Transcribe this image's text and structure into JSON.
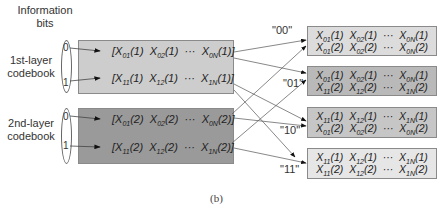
{
  "labels": {
    "information_bits_line1": "Information",
    "information_bits_line2": "bits",
    "layer1_line1": "1st-layer",
    "layer1_line2": "codebook",
    "layer2_line1": "2nd-layer",
    "layer2_line2": "codebook",
    "caption": "(b)"
  },
  "layer1": {
    "bits": [
      "0",
      "1"
    ],
    "rows": [
      {
        "bit": "0",
        "items": [
          [
            "X",
            "01",
            "(1)"
          ],
          [
            "X",
            "02",
            "(1)"
          ],
          [
            "X",
            "0N",
            "(1)"
          ]
        ]
      },
      {
        "bit": "1",
        "items": [
          [
            "X",
            "11",
            "(1)"
          ],
          [
            "X",
            "12",
            "(1)"
          ],
          [
            "X",
            "1N",
            "(1)"
          ]
        ]
      }
    ]
  },
  "layer2": {
    "bits": [
      "0",
      "1"
    ],
    "rows": [
      {
        "bit": "0",
        "items": [
          [
            "X",
            "01",
            "(2)"
          ],
          [
            "X",
            "02",
            "(2)"
          ],
          [
            "X",
            "0N",
            "(2)"
          ]
        ]
      },
      {
        "bit": "1",
        "items": [
          [
            "X",
            "11",
            "(2)"
          ],
          [
            "X",
            "12",
            "(2)"
          ],
          [
            "X",
            "1N",
            "(2)"
          ]
        ]
      }
    ]
  },
  "outputs": [
    {
      "code": "\"00\"",
      "line1": [
        "01",
        "02",
        "0N",
        "(1)"
      ],
      "line2": [
        "01",
        "02",
        "0N",
        "(2)"
      ]
    },
    {
      "code": "\"01\"",
      "line1": [
        "01",
        "02",
        "0N",
        "(1)"
      ],
      "line2": [
        "11",
        "12",
        "1N",
        "(2)"
      ]
    },
    {
      "code": "\"10\"",
      "line1": [
        "11",
        "12",
        "1N",
        "(1)"
      ],
      "line2": [
        "01",
        "02",
        "0N",
        "(2)"
      ]
    },
    {
      "code": "\"11\"",
      "line1": [
        "11",
        "12",
        "1N",
        "(1)"
      ],
      "line2": [
        "11",
        "12",
        "1N",
        "(2)"
      ]
    }
  ],
  "ellipsis": "···",
  "colors": {
    "layer1_box": "#cdcdcd",
    "layer2_box": "#9a9a9a",
    "out_00": "#dcdcdc",
    "out_01": "#b9b9b9",
    "out_10": "#c6c6c6",
    "out_11": "#e6e6e6"
  }
}
